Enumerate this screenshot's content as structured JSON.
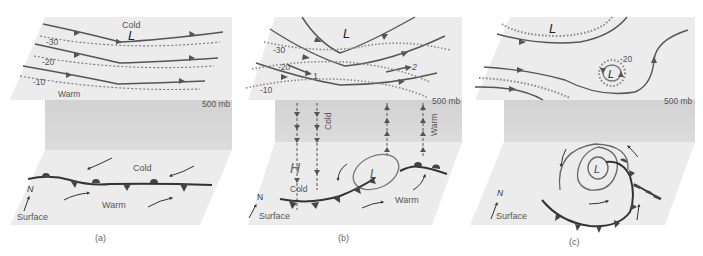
{
  "panels": [
    {
      "id": "a",
      "caption": "(a)",
      "upper": {
        "level_label": "500 mb",
        "low_label": "L",
        "cold_label": "Cold",
        "warm_label": "Warm",
        "isotherms": [
          "-30",
          "-20",
          "-10"
        ]
      },
      "surface": {
        "label": "Surface",
        "north_label": "N",
        "cold_label": "Cold",
        "warm_label": "Warm",
        "front_type": "stationary"
      }
    },
    {
      "id": "b",
      "caption": "(b)",
      "upper": {
        "level_label": "500 mb",
        "low_label": "L",
        "isotherms": [
          "-30",
          "-20",
          "-10"
        ],
        "markers": [
          "1",
          "2"
        ]
      },
      "column": {
        "cold_label": "Cold",
        "warm_label": "Warm"
      },
      "surface": {
        "label": "Surface",
        "north_label": "N",
        "high_label": "H",
        "low_label": "L",
        "cold_label": "Cold",
        "warm_label": "Warm",
        "front_type": "cold-and-warm"
      }
    },
    {
      "id": "c",
      "caption": "(c)",
      "upper": {
        "level_label": "500 mb",
        "low_label": "L",
        "cutoff_low_label": "L",
        "isotherms": [
          "-20"
        ]
      },
      "surface": {
        "label": "Surface",
        "north_label": "N",
        "low_label": "L",
        "front_type": "occluded"
      }
    }
  ],
  "colors": {
    "plane": "#ececec",
    "column": "#d6d6d6",
    "streamline": "#555555",
    "isotherm": "#8a8a8a",
    "front": "#444444",
    "isobar": "#777777"
  }
}
